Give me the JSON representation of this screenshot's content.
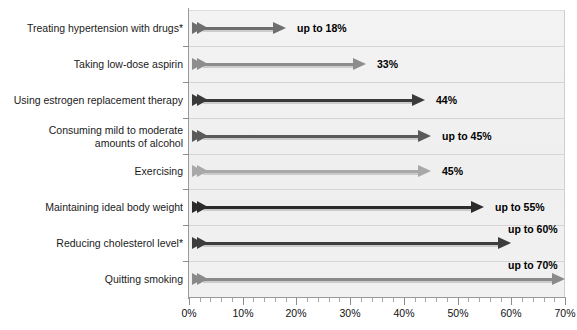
{
  "chart_data": {
    "type": "bar",
    "title": "",
    "subtitle": "",
    "xlabel": "",
    "ylabel": "",
    "xlim": [
      0,
      70
    ],
    "xtick_labels": [
      "0%",
      "10%",
      "20%",
      "30%",
      "40%",
      "50%",
      "60%",
      "70%"
    ],
    "xtick_values": [
      0,
      10,
      20,
      30,
      40,
      50,
      60,
      70
    ],
    "minor_tick_step": 2,
    "grid": "horizontal",
    "legend": "none",
    "orientation": "horizontal",
    "categories": [
      "Treating hypertension with drugs*",
      "Taking low-dose aspirin",
      "Using estrogen replacement therapy",
      "Consuming mild to moderate\namounts of alcohol",
      "Exercising",
      "Maintaining ideal body weight",
      "Reducing cholesterol level*",
      "Quitting smoking"
    ],
    "values": [
      18,
      33,
      44,
      45,
      45,
      55,
      60,
      70
    ],
    "data_labels": [
      "up to 18%",
      "33%",
      "44%",
      "up to 45%",
      "45%",
      "up to 55%",
      "up to 60%",
      "up to 70%"
    ],
    "series_colors": [
      "#6e6e6e",
      "#8d8d8d",
      "#3a3a3a",
      "#5a5a5a",
      "#a8a8a8",
      "#2b2b2b",
      "#3d3d3d",
      "#8a8a8a"
    ],
    "plot_background": "#f1f1f1",
    "gridline_color": "#d5d5d5",
    "axis_color": "#9a9a9a",
    "label_color": "#1a1a1a",
    "footnote_marker": "*"
  }
}
